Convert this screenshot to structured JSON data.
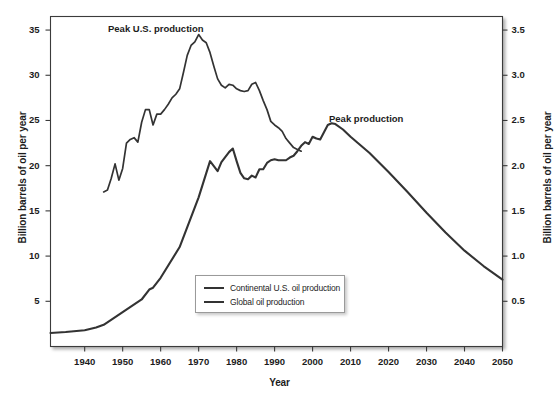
{
  "chart_data": {
    "type": "line",
    "title": "",
    "xlabel": "Year",
    "ylabel": "Billion barrels of oil per year",
    "ylabel_right": "Billion barrels of oil per year",
    "xlim": [
      1931,
      2050
    ],
    "ylim": [
      0,
      36.5
    ],
    "ylim_right": [
      0,
      3.65
    ],
    "grid": false,
    "legend_position": "lower-center",
    "xticks": [
      1940,
      1950,
      1960,
      1970,
      1980,
      1990,
      2000,
      2010,
      2020,
      2030,
      2040,
      2050
    ],
    "xticklabels": [
      "1940",
      "1950",
      "1960",
      "1970",
      "1980",
      "1990",
      "2000",
      "2010",
      "2020",
      "2030",
      "2040",
      "2050"
    ],
    "yticks_left": [
      5,
      10,
      15,
      20,
      25,
      30,
      35
    ],
    "yticklabels_left": [
      "5",
      "10",
      "15",
      "20",
      "25",
      "30",
      "35"
    ],
    "yticks_right": [
      0.5,
      1.0,
      1.5,
      2.0,
      2.5,
      3.0,
      3.5
    ],
    "yticklabels_right": [
      "0.5",
      "1.0",
      "1.5",
      "2.0",
      "2.5",
      "3.0",
      "3.5"
    ],
    "annotations": [
      {
        "text": "Peak U.S. production",
        "x": 1962,
        "y": 36.0
      },
      {
        "text": "Peak production",
        "x": 2003,
        "y": 26.3
      }
    ],
    "line_color": "#333333",
    "series": [
      {
        "name": "Continental U.S. oil production",
        "axis": "right",
        "color": "#333333",
        "x": [
          1945,
          1946,
          1947,
          1948,
          1949,
          1950,
          1951,
          1952,
          1953,
          1954,
          1955,
          1956,
          1957,
          1958,
          1959,
          1960,
          1961,
          1962,
          1963,
          1964,
          1965,
          1966,
          1967,
          1968,
          1969,
          1970,
          1971,
          1972,
          1973,
          1974,
          1975,
          1976,
          1977,
          1978,
          1979,
          1980,
          1981,
          1982,
          1983,
          1984,
          1985,
          1986,
          1987,
          1988,
          1989,
          1990,
          1991,
          1992,
          1993,
          1994,
          1995,
          1996,
          1997
        ],
        "y": [
          1.71,
          1.73,
          1.86,
          2.02,
          1.84,
          1.97,
          2.25,
          2.29,
          2.31,
          2.26,
          2.48,
          2.62,
          2.62,
          2.45,
          2.57,
          2.57,
          2.62,
          2.68,
          2.75,
          2.79,
          2.85,
          3.03,
          3.22,
          3.33,
          3.37,
          3.45,
          3.39,
          3.36,
          3.25,
          3.1,
          2.96,
          2.89,
          2.86,
          2.9,
          2.89,
          2.85,
          2.83,
          2.82,
          2.83,
          2.9,
          2.92,
          2.83,
          2.72,
          2.62,
          2.49,
          2.45,
          2.42,
          2.38,
          2.3,
          2.25,
          2.2,
          2.18,
          2.16
        ]
      },
      {
        "name": "Global oil production",
        "axis": "left",
        "color": "#333333",
        "x": [
          1931,
          1935,
          1940,
          1943,
          1945,
          1950,
          1955,
          1957,
          1958,
          1960,
          1965,
          1970,
          1973,
          1975,
          1976,
          1978,
          1979,
          1980,
          1981,
          1982,
          1983,
          1984,
          1985,
          1986,
          1987,
          1988,
          1989,
          1990,
          1991,
          1992,
          1993,
          1994,
          1995,
          1996,
          1997,
          1998,
          1999,
          2000,
          2001,
          2002,
          2003,
          2004,
          2005,
          2006,
          2008,
          2010,
          2015,
          2020,
          2025,
          2030,
          2035,
          2040,
          2045,
          2050
        ],
        "y": [
          1.5,
          1.6,
          1.8,
          2.1,
          2.4,
          3.8,
          5.2,
          6.3,
          6.5,
          7.6,
          11.0,
          16.5,
          20.5,
          19.4,
          20.4,
          21.5,
          21.9,
          20.5,
          19.2,
          18.6,
          18.5,
          18.9,
          18.7,
          19.6,
          19.6,
          20.3,
          20.6,
          20.7,
          20.6,
          20.6,
          20.6,
          20.9,
          21.1,
          21.6,
          22.2,
          22.6,
          22.4,
          23.2,
          23.0,
          22.9,
          23.7,
          24.5,
          24.7,
          24.6,
          24.0,
          23.2,
          21.4,
          19.3,
          17.1,
          14.8,
          12.6,
          10.6,
          8.9,
          7.4
        ]
      }
    ]
  },
  "legend": {
    "items": [
      {
        "label": "Continental U.S. oil production"
      },
      {
        "label": "Global oil production"
      }
    ]
  },
  "axes": {
    "x_title": "Year",
    "y_title_left": "Billion barrels of oil per year",
    "y_title_right": "Billion barrels of oil per year"
  }
}
